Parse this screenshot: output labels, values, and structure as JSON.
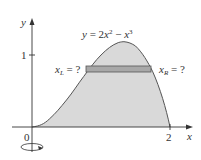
{
  "figure": {
    "equation": "y = 2x² − x³",
    "equation_parts": {
      "lhs": "y = 2",
      "x1": "x",
      "sup1": "2",
      "mid": " − ",
      "x2": "x",
      "sup2": "3"
    },
    "axis_x_label": "x",
    "axis_y_label": "y",
    "tick_y": "1",
    "tick_x": "2",
    "origin_label": "0",
    "left_label": {
      "var": "x",
      "sub": "L",
      "rest": " = ?"
    },
    "right_label": {
      "var": "x",
      "sub": "R",
      "rest": " = ?"
    },
    "rotation_icon": "rotation-about-y-axis-icon",
    "colors": {
      "fill": "#d9d9d9",
      "curve": "#555555",
      "strip": "#a8a8a8",
      "axes": "#333333"
    }
  }
}
